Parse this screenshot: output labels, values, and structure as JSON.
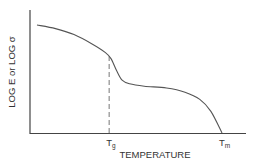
{
  "chart_data": {
    "type": "line",
    "title": "",
    "xlabel": "TEMPERATURE",
    "ylabel": "LOG E  or  LOG σ",
    "x_ticks": [
      {
        "label": "T",
        "sub": "g",
        "x": 0.39
      },
      {
        "label": "T",
        "sub": "m",
        "x": 1.0
      }
    ],
    "x_range": [
      -0.04,
      1.12
    ],
    "y_range": [
      0,
      1
    ],
    "grid": false,
    "legend": "none",
    "series": [
      {
        "name": "modulus-curve",
        "points": [
          [
            0.0,
            0.9
          ],
          [
            0.1,
            0.87
          ],
          [
            0.2,
            0.82
          ],
          [
            0.3,
            0.74
          ],
          [
            0.37,
            0.67
          ],
          [
            0.4,
            0.62
          ],
          [
            0.43,
            0.52
          ],
          [
            0.46,
            0.44
          ],
          [
            0.5,
            0.41
          ],
          [
            0.58,
            0.39
          ],
          [
            0.7,
            0.375
          ],
          [
            0.8,
            0.34
          ],
          [
            0.88,
            0.28
          ],
          [
            0.94,
            0.18
          ],
          [
            1.0,
            0.0
          ]
        ]
      }
    ],
    "annotations": [
      {
        "type": "dashed-vertical",
        "at": 0.39,
        "label": "Tg"
      }
    ],
    "colors": {
      "line": "#555555",
      "axis": "#444444",
      "dash": "#777777"
    }
  }
}
